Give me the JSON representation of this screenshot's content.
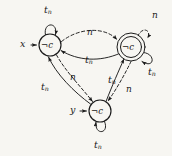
{
  "figure": {
    "type": "state-machine-diagram",
    "background_color": "#f7f6f2",
    "ink_color": "#1b1b1b"
  },
  "symbols": {
    "not": "¬",
    "t_base": "t",
    "t_sub": "n",
    "n_base": "n",
    "c": "c"
  },
  "nodes": [
    {
      "id": "q-left",
      "label_prefix": "¬",
      "label_main": "c",
      "shape": "circle",
      "cx": 50,
      "cy": 45,
      "r": 11
    },
    {
      "id": "q-right",
      "label_prefix": "¬",
      "label_main": "c",
      "shape": "double-circle",
      "cx": 131,
      "cy": 47,
      "r": 11,
      "r_outer": 14
    },
    {
      "id": "q-bottom",
      "label_prefix": "¬",
      "label_main": "c",
      "shape": "circle",
      "cx": 100,
      "cy": 111,
      "r": 11
    }
  ],
  "inputs": [
    {
      "id": "input-x",
      "label": "x",
      "target": "q-left",
      "x": 20,
      "y": 40
    },
    {
      "id": "input-y",
      "label": "y",
      "target": "q-bottom",
      "x": 70,
      "y": 106
    }
  ],
  "edge_labels": [
    {
      "id": "label-selfloop-left",
      "base": "t",
      "sub": "n",
      "x": 44,
      "y": 6,
      "style": "solid"
    },
    {
      "id": "label-top-n",
      "base": "n",
      "sub": "",
      "x": 87,
      "y": 29,
      "style": "dashed"
    },
    {
      "id": "label-selfloop-right-n",
      "base": "n",
      "sub": "",
      "x": 152,
      "y": 12,
      "style": "dashed"
    },
    {
      "id": "label-selfloop-right-t",
      "base": "t",
      "sub": "n",
      "x": 148,
      "y": 68,
      "style": "solid"
    },
    {
      "id": "label-mid-t",
      "base": "t",
      "sub": "n",
      "x": 85,
      "y": 56,
      "style": "solid"
    },
    {
      "id": "label-left-n",
      "base": "n",
      "sub": "",
      "x": 70,
      "y": 74,
      "style": "dashed"
    },
    {
      "id": "label-left-t",
      "base": "t",
      "sub": "n",
      "x": 41,
      "y": 83,
      "style": "solid"
    },
    {
      "id": "label-right-t",
      "base": "t",
      "sub": "n",
      "x": 108,
      "y": 76,
      "style": "solid"
    },
    {
      "id": "label-right-n",
      "base": "n",
      "sub": "",
      "x": 126,
      "y": 86,
      "style": "dashed"
    },
    {
      "id": "label-selfloop-bottom",
      "base": "t",
      "sub": "n",
      "x": 94,
      "y": 141,
      "style": "solid"
    }
  ],
  "edges": [
    {
      "id": "edge-left-selfloop",
      "from": "q-left",
      "to": "q-left",
      "style": "solid",
      "label": "t_n"
    },
    {
      "id": "edge-left-to-right-top",
      "from": "q-left",
      "to": "q-right",
      "style": "dashed",
      "label": "n"
    },
    {
      "id": "edge-right-to-left-mid",
      "from": "q-right",
      "to": "q-left",
      "style": "solid",
      "label": "t_n"
    },
    {
      "id": "edge-right-selfloop-n",
      "from": "q-right",
      "to": "q-right",
      "style": "dashed",
      "label": "n"
    },
    {
      "id": "edge-right-selfloop-t",
      "from": "q-right",
      "to": "q-right",
      "style": "solid",
      "label": "t_n"
    },
    {
      "id": "edge-left-to-bottom-n",
      "from": "q-left",
      "to": "q-bottom",
      "style": "dashed",
      "label": "n"
    },
    {
      "id": "edge-bottom-to-left-t",
      "from": "q-bottom",
      "to": "q-left",
      "style": "solid",
      "label": "t_n"
    },
    {
      "id": "edge-bottom-to-right-t",
      "from": "q-bottom",
      "to": "q-right",
      "style": "solid",
      "label": "t_n"
    },
    {
      "id": "edge-right-to-bottom-n",
      "from": "q-right",
      "to": "q-bottom",
      "style": "dashed",
      "label": "n"
    },
    {
      "id": "edge-bottom-selfloop",
      "from": "q-bottom",
      "to": "q-bottom",
      "style": "solid",
      "label": "t_n"
    }
  ]
}
